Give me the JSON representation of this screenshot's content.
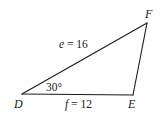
{
  "diagram": {
    "type": "triangle",
    "vertices": {
      "D": {
        "label": "D",
        "x": 22,
        "y": 94
      },
      "E": {
        "label": "E",
        "x": 133,
        "y": 95
      },
      "F": {
        "label": "F",
        "x": 147,
        "y": 23
      }
    },
    "sides": {
      "e": {
        "var": "e",
        "eq": " = 16",
        "text": "e = 16",
        "between": [
          "D",
          "F"
        ],
        "length": 16
      },
      "f": {
        "var": "f",
        "eq": " = 12",
        "text": "f = 12",
        "between": [
          "D",
          "E"
        ],
        "length": 12
      }
    },
    "angles": {
      "D": {
        "text": "30°",
        "value": 30,
        "unit": "degrees"
      }
    },
    "colors": {
      "stroke": "#1a1a1a",
      "background": "#ffffff"
    }
  }
}
